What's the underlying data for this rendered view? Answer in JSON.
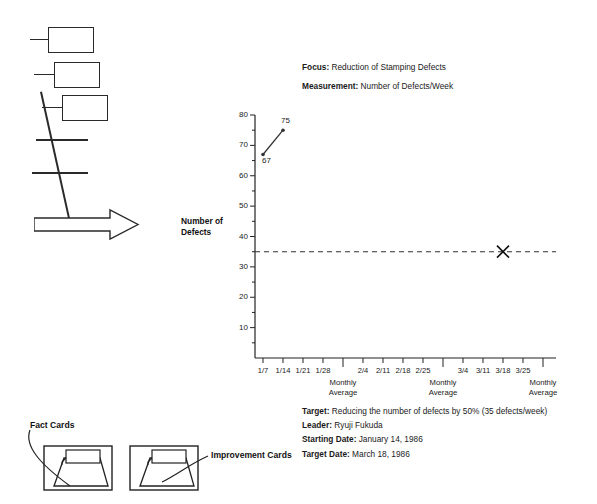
{
  "header": {
    "focus_key": "Focus:",
    "focus_value": "Reduction of Stamping  Defects",
    "measurement_key": "Measurement:",
    "measurement_value": "Number of Defects/Week"
  },
  "meta": {
    "rows": [
      {
        "key": "Target:",
        "value": "Reducing the number of defects by 50% (35 defects/week)"
      },
      {
        "key": "Leader:",
        "value": "Ryuji Fukuda"
      },
      {
        "key": "Starting Date:",
        "value": "January 14, 1986"
      },
      {
        "key": "Target Date:",
        "value": "March 18, 1986"
      }
    ]
  },
  "cards": {
    "fact_label": "Fact Cards",
    "improvement_label": "Improvement Cards"
  },
  "chart_data": {
    "type": "line",
    "title": "",
    "xlabel": "",
    "ylabel": "Number of\nDefects",
    "ylabel_line1": "Number of",
    "ylabel_line2": "Defects",
    "ylim": [
      0,
      80
    ],
    "ytick_step": 10,
    "yticks": [
      10,
      20,
      30,
      40,
      50,
      60,
      70,
      80
    ],
    "ytick_labels": [
      "10",
      "20",
      "30",
      "40",
      "50",
      "60",
      "70",
      "80"
    ],
    "minor_tick_step": 5,
    "grid": false,
    "legend": "none",
    "categories": [
      "1/7",
      "1/14",
      "1/21",
      "1/28",
      "MA1",
      "2/4",
      "2/11",
      "2/18",
      "2/25",
      "MA2",
      "3/4",
      "3/11",
      "3/18",
      "3/25",
      "MA3"
    ],
    "xtick_labels": [
      "1/7",
      "1/14",
      "1/21",
      "1/28",
      "",
      "2/4",
      "2/11",
      "2/18",
      "2/25",
      "",
      "3/4",
      "3/11",
      "3/18",
      "3/25",
      ""
    ],
    "monthly_average_label_line1": "Monthly",
    "monthly_average_label_line2": "Average",
    "monthly_average_positions": [
      "MA1",
      "MA2",
      "MA3"
    ],
    "series": [
      {
        "name": "Defects per week",
        "points": [
          {
            "x": "1/7",
            "y": 67,
            "label": "67"
          },
          {
            "x": "1/14",
            "y": 75,
            "label": "75"
          }
        ]
      }
    ],
    "target_line": {
      "value": 35,
      "style": "dashed",
      "label": ""
    },
    "target_marker": {
      "x": "3/18",
      "y": 35,
      "shape": "x-cross"
    }
  }
}
